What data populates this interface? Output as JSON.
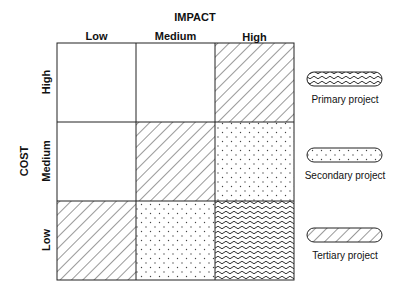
{
  "diagram": {
    "x_axis": {
      "title": "IMPACT",
      "levels": [
        "Low",
        "Medium",
        "High"
      ]
    },
    "y_axis": {
      "title": "COST",
      "levels": [
        "High",
        "Medium",
        "Low"
      ]
    },
    "grid": [
      [
        "none",
        "none",
        "tertiary"
      ],
      [
        "none",
        "tertiary",
        "secondary"
      ],
      [
        "tertiary",
        "secondary",
        "primary"
      ]
    ]
  },
  "legend": {
    "items": [
      {
        "key": "primary",
        "label": "Primary project",
        "pattern": "wavy"
      },
      {
        "key": "secondary",
        "label": "Secondary project",
        "pattern": "dots"
      },
      {
        "key": "tertiary",
        "label": "Tertiary project",
        "pattern": "diagonal-hatch"
      }
    ]
  }
}
